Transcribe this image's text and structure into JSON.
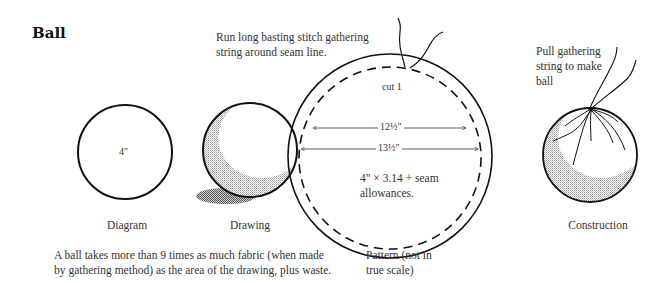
{
  "title": "Ball",
  "annotations": {
    "basting_note": [
      "Run long basting stitch gathering",
      "string around seam line."
    ],
    "pull_note": [
      "Pull gathering",
      "string to make",
      "ball"
    ],
    "cut": "cut 1",
    "inner_dimension": "12½\"",
    "outer_dimension": "13½\"",
    "formula": [
      "4\" × 3.14 + seam",
      "allowances."
    ],
    "diagram_size": "4\""
  },
  "captions": {
    "diagram": "Diagram",
    "drawing": "Drawing",
    "pattern": [
      "Pattern (not in",
      "true scale)"
    ],
    "construction": "Construction"
  },
  "footnote": [
    "A ball takes more than 9 times as much fabric (when made",
    "by gathering method) as the area of the drawing, plus waste."
  ],
  "colors": {
    "ink": "#111111",
    "shade": "#c8c8c8",
    "shadow": "#8a8a8a"
  }
}
